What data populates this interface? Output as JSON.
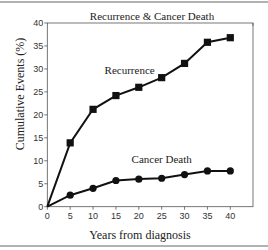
{
  "chart_data": {
    "type": "line",
    "title": "Recurrence & Cancer Death",
    "xlabel": "Years from diagnosis",
    "ylabel": "Cumulative Events (%)",
    "x": [
      0,
      5,
      10,
      15,
      20,
      25,
      30,
      35,
      40
    ],
    "xlim": [
      0,
      40
    ],
    "ylim": [
      0,
      40
    ],
    "xticks": [
      0,
      5,
      10,
      15,
      20,
      25,
      30,
      35,
      40
    ],
    "yticks": [
      0,
      5,
      10,
      15,
      20,
      25,
      30,
      35,
      40
    ],
    "grid": false,
    "legend": "inline labels",
    "series": [
      {
        "name": "Recurrence",
        "marker": "square",
        "color": "#111111",
        "values": [
          0,
          13.9,
          21.2,
          24.2,
          26.0,
          28.1,
          31.2,
          35.8,
          36.8
        ]
      },
      {
        "name": "Cancer Death",
        "marker": "circle",
        "color": "#111111",
        "values": [
          0,
          2.5,
          4.0,
          5.7,
          6.0,
          6.2,
          7.0,
          7.8,
          7.8
        ]
      }
    ],
    "annotations": [
      {
        "text": "Recurrence",
        "x": 18,
        "y": 29
      },
      {
        "text": "Cancer Death",
        "x": 25,
        "y": 9.5
      }
    ]
  }
}
